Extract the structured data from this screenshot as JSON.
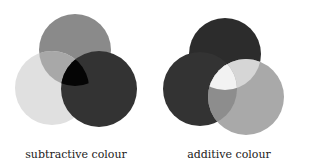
{
  "diagrams": [
    {
      "caption": "subtractive colour",
      "circles": [
        {
          "name": "top",
          "cx": 75,
          "cy": 50,
          "r": 36,
          "color": "#8a8a8a"
        },
        {
          "name": "left",
          "cx": 52,
          "cy": 88,
          "r": 37,
          "color": "#e0e0e0"
        },
        {
          "name": "right",
          "cx": 99,
          "cy": 89,
          "r": 38,
          "color": "#333333"
        }
      ],
      "overlaps": {
        "top_left": "#a8a8a8",
        "all": "#050505"
      }
    },
    {
      "caption": "additive colour",
      "circles": [
        {
          "name": "top",
          "cx": 225,
          "cy": 54,
          "r": 36,
          "color": "#2c2c2c"
        },
        {
          "name": "left",
          "cx": 200,
          "cy": 89,
          "r": 37,
          "color": "#333333"
        },
        {
          "name": "right",
          "cx": 246,
          "cy": 97,
          "r": 38,
          "color": "#a9a9a9"
        }
      ],
      "overlaps": {
        "top_right": "#d6d6d6",
        "left_right": "#8d8d8d",
        "all": "#f2f2f2"
      }
    }
  ]
}
